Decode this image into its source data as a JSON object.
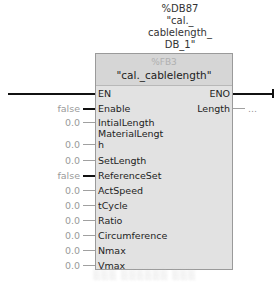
{
  "instance": {
    "address": "%DB87",
    "name_lines": [
      "\"cal._",
      "cablelength_",
      "DB_1\""
    ]
  },
  "block": {
    "number": "%FB3",
    "name": "\"cal._cablelength\"",
    "inputs": [
      {
        "name": "EN",
        "value": "",
        "top": 88
      },
      {
        "name": "Enable",
        "value": "false",
        "top": 103
      },
      {
        "name": "IntialLength",
        "value": "0.0",
        "top": 117
      },
      {
        "name": "MaterialLengt",
        "value": "",
        "top": 128
      },
      {
        "name": "h",
        "value": "0.0",
        "top": 139
      },
      {
        "name": "SetLength",
        "value": "0.0",
        "top": 155
      },
      {
        "name": "ReferenceSet",
        "value": "false",
        "top": 170
      },
      {
        "name": "ActSpeed",
        "value": "0.0",
        "top": 185
      },
      {
        "name": "tCycle",
        "value": "0.0",
        "top": 200
      },
      {
        "name": "Ratio",
        "value": "0.0",
        "top": 215
      },
      {
        "name": "Circumference",
        "value": "0.0",
        "top": 230
      },
      {
        "name": "Nmax",
        "value": "0.0",
        "top": 245
      },
      {
        "name": "Vmax",
        "value": "0.0",
        "top": 260
      }
    ],
    "outputs": [
      {
        "name": "ENO",
        "value": "",
        "top": 88
      },
      {
        "name": "Length",
        "value": "...",
        "top": 103
      }
    ]
  },
  "caption": "░░░ ░░░░░░ ░░░"
}
